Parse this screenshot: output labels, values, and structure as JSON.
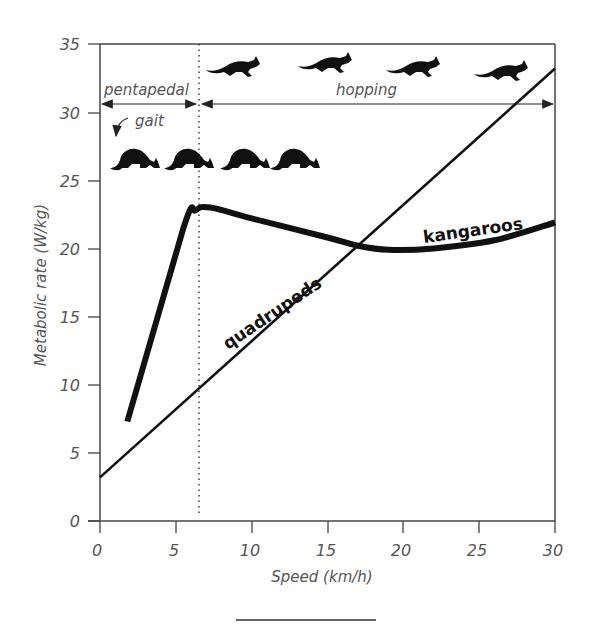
{
  "chart_data": {
    "type": "line",
    "title": "",
    "xlabel": "Speed (km/h)",
    "ylabel": "Metabolic rate (W/kg)",
    "xlim": [
      0,
      30
    ],
    "ylim": [
      0,
      35
    ],
    "xticks": [
      0,
      5,
      10,
      15,
      20,
      25,
      30
    ],
    "yticks": [
      0,
      5,
      10,
      15,
      20,
      25,
      30,
      35
    ],
    "grid": false,
    "legend": "none (series labeled inline)",
    "series": [
      {
        "name": "kangaroos",
        "style": "thick",
        "x": [
          1.8,
          5.5,
          6.3,
          7.3,
          10,
          15,
          17,
          19,
          22,
          26,
          30
        ],
        "y": [
          7.3,
          21.5,
          22.8,
          23.0,
          22.2,
          20.8,
          20.2,
          19.9,
          20.0,
          20.6,
          21.9
        ]
      },
      {
        "name": "quadrupeds",
        "style": "thin",
        "x": [
          0,
          30
        ],
        "y": [
          3.2,
          33.2
        ]
      }
    ],
    "annotations": [
      {
        "text": "pentapedal",
        "x_range": [
          0,
          6.6
        ],
        "y": 30.5,
        "type": "double-arrow"
      },
      {
        "text": "hopping",
        "x_range": [
          6.6,
          30
        ],
        "y": 30.5,
        "type": "double-arrow"
      },
      {
        "text": "gait",
        "x": 2.0,
        "y": 28.5,
        "type": "curved-arrow-label"
      },
      {
        "text": "gait transition",
        "x": 6.6,
        "type": "dotted-vertical-line"
      },
      {
        "text": "kangaroo silhouettes (crawling)",
        "count": 4,
        "y": 26
      },
      {
        "text": "kangaroo silhouettes (hopping)",
        "count": 4,
        "y": 33
      }
    ]
  },
  "axes": {
    "x_label": "Speed (km/h)",
    "y_label": "Metabolic rate (W/kg)",
    "x_ticks": [
      "0",
      "5",
      "10",
      "15",
      "20",
      "25",
      "30"
    ],
    "y_ticks": [
      "0",
      "5",
      "10",
      "15",
      "20",
      "25",
      "30",
      "35"
    ]
  },
  "labels": {
    "pentapedal": "pentapedal",
    "hopping": "hopping",
    "gait": "gait",
    "kangaroos": "kangaroos",
    "quadrupeds": "quadrupeds"
  },
  "colors": {
    "line": "#111111",
    "axis": "#444444",
    "text": "#555555"
  }
}
